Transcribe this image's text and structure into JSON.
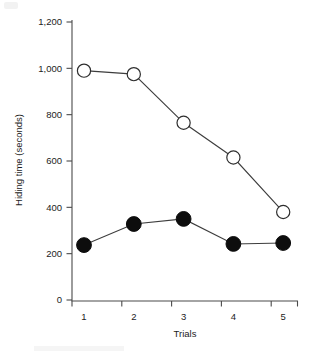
{
  "chart_data": {
    "type": "line",
    "title": "",
    "xlabel": "Trials",
    "ylabel": "Hiding time (seconds)",
    "categories": [
      "1",
      "2",
      "3",
      "4",
      "5"
    ],
    "x": [
      1,
      2,
      3,
      4,
      5
    ],
    "xlim": [
      0.6,
      5.4
    ],
    "ylim": [
      0,
      1200
    ],
    "yticks": [
      0,
      200,
      400,
      600,
      800,
      1000,
      1200
    ],
    "ytick_labels": [
      "0",
      "200",
      "400",
      "600",
      "800",
      "1,000",
      "1,200"
    ],
    "xtick_labels": [
      "1",
      "2",
      "3",
      "4",
      "5"
    ],
    "grid": false,
    "legend": "none",
    "series": [
      {
        "name": "open-circles",
        "marker": "open-circle",
        "color": "#2e2e2e",
        "fill": "#ffffff",
        "values": [
          990,
          975,
          765,
          615,
          380
        ]
      },
      {
        "name": "filled-circles",
        "marker": "filled-circle",
        "color": "#0d0d0d",
        "fill": "#0d0d0d",
        "values": [
          237,
          328,
          350,
          242,
          246
        ]
      }
    ]
  },
  "colors": {
    "axis": "#4a4a4a",
    "line": "#3d3d3d",
    "text": "#1c1c1c",
    "background": "#ffffff"
  }
}
